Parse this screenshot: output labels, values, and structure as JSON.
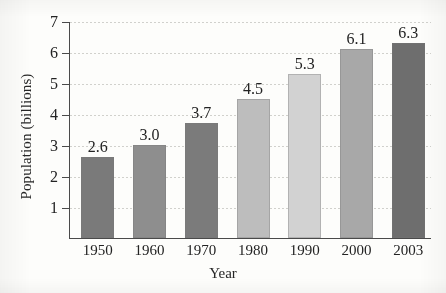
{
  "chart_data": {
    "type": "bar",
    "title": "",
    "xlabel": "Year",
    "ylabel": "Population (billions)",
    "categories": [
      "1950",
      "1960",
      "1970",
      "1980",
      "1990",
      "2000",
      "2003"
    ],
    "values": [
      2.6,
      3.0,
      3.7,
      4.5,
      5.3,
      6.1,
      6.3
    ],
    "value_labels": [
      "2.6",
      "3.0",
      "3.7",
      "4.5",
      "5.3",
      "6.1",
      "6.3"
    ],
    "ylim": [
      0,
      7
    ],
    "yticks": [
      1,
      2,
      3,
      4,
      5,
      6,
      7
    ],
    "ytick_labels": [
      "1",
      "2",
      "3",
      "4",
      "5",
      "6",
      "7"
    ],
    "grid": true,
    "legend": "none",
    "bar_colors": [
      "#7a7a7a",
      "#8e8e8e",
      "#7b7b7b",
      "#bdbdbd",
      "#d2d2d2",
      "#a8a8a8",
      "#6e6e6e"
    ]
  },
  "axes": {
    "axis_color": "#4a4a4a",
    "grid_color": "#c9c9c4",
    "background": "#fdfdfb"
  }
}
